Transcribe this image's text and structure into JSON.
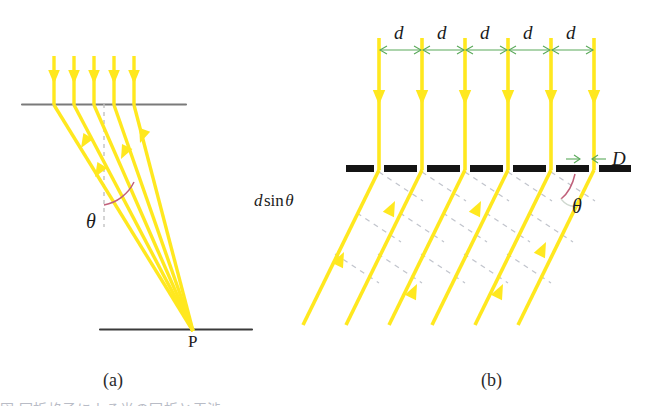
{
  "figure": {
    "background_color": "#ffffff",
    "panels": [
      {
        "id": "a",
        "label": "(a)",
        "description": "Parallel rays incident on a grating converge to point P",
        "point_label": "P",
        "angle_label": "θ",
        "ray_count": 5,
        "ray_color": "#ffe81f",
        "line_color": "#7a7a7a",
        "normal_style": "dashed",
        "arc_color": "#c0607a"
      },
      {
        "id": "b",
        "label": "(b)",
        "description": "Grating slits separated by d, slit width D, diffracted rays at angle theta",
        "spacing_label": "d",
        "spacing_label_count": 5,
        "slit_width_label": "D",
        "path_difference_label": "d sin θ",
        "path_difference_parts": {
          "d": "d",
          "sin": "sin",
          "theta": "θ"
        },
        "angle_label": "θ",
        "ray_count": 6,
        "ray_color": "#ffe81f",
        "grating_color": "#141414",
        "dimension_arrow_color": "#5aa95a",
        "wavefront_color": "#b9bcc6",
        "arc_color": "#c0607a"
      }
    ],
    "caption_faint": "図 回折格子による光の回折と干渉"
  },
  "colors": {
    "ray_yellow": "#ffe81f",
    "ray_yellow_soft": "#fff7a8",
    "gray_line": "#7a7a7a",
    "black_bar": "#141414",
    "green_arrow": "#5aa95a",
    "pink_arc": "#c0607a",
    "dashed_gray": "#b9bcc6",
    "text_dark": "#1b1b1b"
  }
}
